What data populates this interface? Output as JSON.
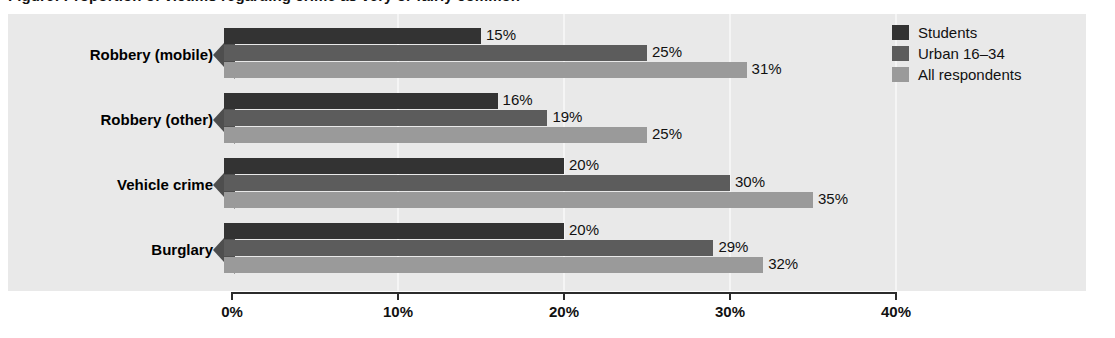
{
  "title": "Figure: Proportion of victims regarding crime as very or fairly common",
  "chart_data": {
    "type": "bar",
    "orientation": "horizontal",
    "title": "",
    "xlabel": "",
    "ylabel": "",
    "xlim": [
      0,
      40
    ],
    "xticks": [
      0,
      10,
      20,
      30,
      40
    ],
    "xticklabels": [
      "0%",
      "10%",
      "20%",
      "30%",
      "40%"
    ],
    "grid": true,
    "legend_position": "top-right",
    "categories": [
      "Robbery (mobile)",
      "Robbery (other)",
      "Vehicle crime",
      "Burglary"
    ],
    "series": [
      {
        "name": "Students",
        "color": "#333333",
        "values": [
          15,
          16,
          20,
          20
        ],
        "labels": [
          "15%",
          "16%",
          "20%",
          "20%"
        ]
      },
      {
        "name": "Urban 16–34",
        "color": "#5c5c5c",
        "values": [
          25,
          19,
          30,
          29
        ],
        "labels": [
          "25%",
          "19%",
          "30%",
          "29%"
        ]
      },
      {
        "name": "All respondents",
        "color": "#9a9a9a",
        "values": [
          31,
          25,
          35,
          32
        ],
        "labels": [
          "31%",
          "25%",
          "35%",
          "32%"
        ]
      }
    ]
  },
  "colors": {
    "panel_background": "#e9e9e9",
    "gridline": "#f5f5f5",
    "axis": "#2b2b2b",
    "arrow": "#4e4e4e",
    "text": "#111111"
  }
}
